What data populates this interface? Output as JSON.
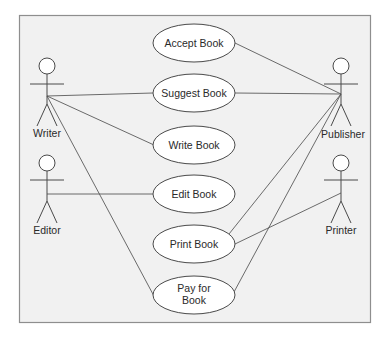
{
  "diagram": {
    "type": "uml-use-case",
    "colors": {
      "background": "#f1f1f1",
      "frame": "#8e8e8e",
      "lines": "#5a5a5a",
      "ellipse_fill": "#ffffff"
    },
    "actors": [
      {
        "id": "writer",
        "label": "Writer",
        "x": 47,
        "y": 66
      },
      {
        "id": "editor",
        "label": "Editor",
        "x": 47,
        "y": 163
      },
      {
        "id": "publisher",
        "label": "Publisher",
        "x": 341,
        "y": 66
      },
      {
        "id": "printer",
        "label": "Printer",
        "x": 341,
        "y": 163
      }
    ],
    "use_cases": [
      {
        "id": "accept-book",
        "lines": [
          "Accept Book"
        ],
        "cx": 194,
        "cy": 43
      },
      {
        "id": "suggest-book",
        "lines": [
          "Suggest Book"
        ],
        "cx": 194,
        "cy": 93
      },
      {
        "id": "write-book",
        "lines": [
          "Write Book"
        ],
        "cx": 194,
        "cy": 145
      },
      {
        "id": "edit-book",
        "lines": [
          "Edit Book"
        ],
        "cx": 194,
        "cy": 194
      },
      {
        "id": "print-book",
        "lines": [
          "Print Book"
        ],
        "cx": 194,
        "cy": 244
      },
      {
        "id": "pay-for-book",
        "lines": [
          "Pay for",
          "Book"
        ],
        "cx": 194,
        "cy": 295
      }
    ],
    "associations": [
      {
        "actor": "writer",
        "use_case": "suggest-book"
      },
      {
        "actor": "writer",
        "use_case": "write-book"
      },
      {
        "actor": "writer",
        "use_case": "pay-for-book"
      },
      {
        "actor": "editor",
        "use_case": "edit-book"
      },
      {
        "actor": "publisher",
        "use_case": "accept-book"
      },
      {
        "actor": "publisher",
        "use_case": "suggest-book"
      },
      {
        "actor": "publisher",
        "use_case": "print-book"
      },
      {
        "actor": "publisher",
        "use_case": "pay-for-book"
      },
      {
        "actor": "printer",
        "use_case": "print-book"
      }
    ]
  },
  "labels": {
    "writer": "Writer",
    "editor": "Editor",
    "publisher": "Publisher",
    "printer": "Printer",
    "accept_book": "Accept Book",
    "suggest_book": "Suggest Book",
    "write_book": "Write Book",
    "edit_book": "Edit Book",
    "print_book": "Print Book",
    "pay_for_book_line1": "Pay for",
    "pay_for_book_line2": "Book"
  }
}
